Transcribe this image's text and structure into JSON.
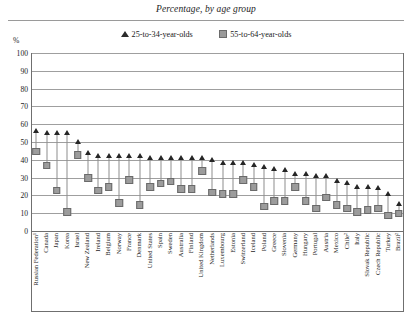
{
  "title": "Percentage, by age group",
  "axis": {
    "unit_label": "%",
    "yticks": [
      100,
      90,
      80,
      70,
      60,
      50,
      40,
      30,
      20,
      10,
      0
    ]
  },
  "legend": [
    {
      "marker": "triangle-marker",
      "label": "25-to-34-year-olds",
      "color": "#262626"
    },
    {
      "marker": "square-marker",
      "label": "55-to-64-year-olds",
      "color": "#9c9c9c"
    }
  ],
  "chart_data": {
    "type": "scatter",
    "title": "Percentage, by age group",
    "xlabel": "",
    "ylabel": "%",
    "ylim": [
      0,
      100
    ],
    "grid": true,
    "legend_position": "top-center",
    "categories": [
      "Russian Federation¹",
      "Canada",
      "Japan",
      "Korea",
      "Israel",
      "New Zealand",
      "Ireland",
      "Belgium",
      "Norway",
      "France",
      "Denmark",
      "United States",
      "Spain",
      "Sweden",
      "Australia",
      "Finland",
      "United Kingdom",
      "Netherlands",
      "Luxembourg",
      "Estonia",
      "Switzerland",
      "Iceland",
      "Poland",
      "Greece",
      "Slovenia",
      "Germany",
      "Hungary",
      "Portugal",
      "Austria",
      "Mexico",
      "Chile²",
      "Italy",
      "Slovak Republic",
      "Czech Republic",
      "Turkey",
      "Brazil²"
    ],
    "series": [
      {
        "name": "25-to-34-year-olds",
        "marker": "triangle",
        "color": "#262626",
        "values": [
          56,
          55,
          55,
          55,
          50,
          44,
          42,
          42,
          42,
          42,
          42,
          41,
          41,
          41,
          41,
          41,
          41,
          40,
          38,
          38,
          38,
          37,
          36,
          35,
          34,
          32,
          32,
          31,
          31,
          28,
          27,
          25,
          25,
          24,
          21,
          15
        ]
      },
      {
        "name": "55-to-64-year-olds",
        "marker": "square",
        "color": "#9c9c9c",
        "values": [
          45,
          37,
          23,
          11,
          43,
          30,
          23,
          25,
          16,
          29,
          15,
          25,
          27,
          28,
          24,
          24,
          34,
          22,
          21,
          21,
          29,
          25,
          14,
          17,
          17,
          25,
          17,
          13,
          19,
          15,
          13,
          11,
          12,
          13,
          9,
          10
        ]
      }
    ]
  }
}
